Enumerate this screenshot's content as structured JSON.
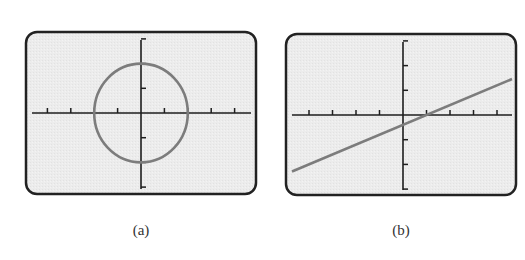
{
  "panels": [
    {
      "label": "(a)",
      "frame": {
        "x": 26,
        "y": 32,
        "w": 230,
        "h": 162,
        "radius": 11
      },
      "origin_px": {
        "x": 141,
        "y": 113
      },
      "x_unit_px": 23.4,
      "y_unit_px": 24.7,
      "x_axis_px": [
        32,
        251
      ],
      "y_axis_px": [
        40,
        189
      ],
      "x_ticks": [
        -4,
        -3,
        -2,
        -1,
        1,
        2,
        3,
        4
      ],
      "y_ticks": [
        -3,
        -2,
        -1,
        1,
        2,
        3
      ]
    },
    {
      "label": "(b)",
      "frame": {
        "x": 286,
        "y": 34,
        "w": 230,
        "h": 161,
        "radius": 11
      },
      "origin_px": {
        "x": 403,
        "y": 115
      },
      "x_unit_px": 23.5,
      "y_unit_px": 24.7,
      "x_axis_px": [
        292,
        512
      ],
      "y_axis_px": [
        42,
        190
      ],
      "x_ticks": [
        -4,
        -3,
        -2,
        -1,
        1,
        2,
        3,
        4
      ],
      "y_ticks": [
        -3,
        -2,
        -1,
        1,
        2,
        3
      ]
    }
  ],
  "colors": {
    "frame_border": "#222222",
    "screen_bg": "#ececec",
    "axis": "#1e1e1e",
    "curve": "#7c7c7c",
    "label": "#333333"
  },
  "chart_data": [
    {
      "type": "line",
      "title": "(a)",
      "description": "Graphing-calculator screen showing a circle centered at the origin",
      "curve": {
        "kind": "circle",
        "center": [
          0,
          0
        ],
        "radius": 2,
        "equation": "x^2 + y^2 = 4"
      },
      "x": [
        2,
        1.414,
        0,
        -1.414,
        -2,
        -1.414,
        0,
        1.414,
        2
      ],
      "y": [
        0,
        1.414,
        2,
        1.414,
        0,
        -1.414,
        -2,
        -1.414,
        0
      ],
      "xlabel": "",
      "ylabel": "",
      "xlim": [
        -4.7,
        4.7
      ],
      "ylim": [
        -3.1,
        3.1
      ],
      "x_ticks": [
        -4,
        -3,
        -2,
        -1,
        1,
        2,
        3,
        4
      ],
      "y_ticks": [
        -3,
        -2,
        -1,
        1,
        2,
        3
      ],
      "grid": false,
      "legend": null
    },
    {
      "type": "line",
      "title": "(b)",
      "description": "Graphing-calculator screen showing a straight line with positive slope",
      "curve": {
        "kind": "line",
        "slope": 0.4,
        "intercept": -0.4,
        "equation": "y = 0.4x - 0.4"
      },
      "x": [
        -4.7,
        -2,
        0,
        1,
        4.6
      ],
      "y": [
        -2.28,
        -1.2,
        -0.4,
        0,
        1.44
      ],
      "xlabel": "",
      "ylabel": "",
      "xlim": [
        -4.7,
        4.7
      ],
      "ylim": [
        -3.1,
        3.1
      ],
      "x_ticks": [
        -4,
        -3,
        -2,
        -1,
        1,
        2,
        3,
        4
      ],
      "y_ticks": [
        -3,
        -2,
        -1,
        1,
        2,
        3
      ],
      "grid": false,
      "legend": null
    }
  ]
}
